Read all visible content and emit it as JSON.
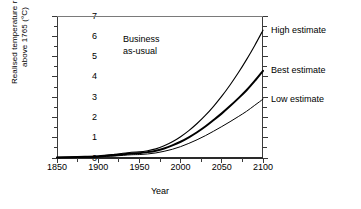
{
  "chart_data": {
    "type": "line",
    "title": "",
    "annotation": "Business\nas-usual",
    "xlabel": "Year",
    "ylabel": "Realised temperature rise\nabove 1765 (°C)",
    "xlim": [
      1850,
      2100
    ],
    "ylim": [
      0,
      7
    ],
    "xticks": [
      1850,
      1900,
      1950,
      2000,
      2050,
      2100
    ],
    "xticklabels": [
      "1850",
      "1900",
      "1950",
      "2000",
      "2050",
      "2100"
    ],
    "xminorticks": [
      1875,
      1925,
      1975,
      2025,
      2075
    ],
    "yticks": [
      0,
      1,
      2,
      3,
      4,
      5,
      6,
      7
    ],
    "yticklabels": [
      "0",
      "1",
      "2",
      "3",
      "4",
      "5",
      "6",
      "7"
    ],
    "yminorticks": [
      0.5,
      1.5,
      2.5,
      3.5,
      4.5,
      5.5,
      6.5
    ],
    "grid": false,
    "legend_position": "right-of-axes",
    "x": [
      1850,
      1875,
      1900,
      1920,
      1940,
      1950,
      1960,
      1970,
      1980,
      1990,
      2000,
      2010,
      2020,
      2030,
      2040,
      2050,
      2060,
      2070,
      2080,
      2090,
      2100
    ],
    "series": [
      {
        "name": "High estimate",
        "label": "High estimate",
        "color": "#000000",
        "linewidth": 1.1,
        "values": [
          0.03,
          0.06,
          0.1,
          0.18,
          0.28,
          0.3,
          0.36,
          0.45,
          0.6,
          0.8,
          1.05,
          1.35,
          1.7,
          2.1,
          2.55,
          3.05,
          3.6,
          4.2,
          4.85,
          5.55,
          6.3
        ]
      },
      {
        "name": "Best estimate",
        "label": "Best estimate",
        "color": "#000000",
        "linewidth": 2.0,
        "values": [
          0.02,
          0.05,
          0.08,
          0.14,
          0.22,
          0.24,
          0.29,
          0.36,
          0.47,
          0.62,
          0.8,
          1.02,
          1.27,
          1.55,
          1.87,
          2.2,
          2.56,
          2.94,
          3.34,
          3.8,
          4.3
        ]
      },
      {
        "name": "Low estimate",
        "label": "Low estimate",
        "color": "#000000",
        "linewidth": 1.0,
        "values": [
          0.02,
          0.04,
          0.06,
          0.1,
          0.16,
          0.17,
          0.2,
          0.25,
          0.33,
          0.43,
          0.56,
          0.72,
          0.9,
          1.1,
          1.32,
          1.55,
          1.79,
          2.04,
          2.3,
          2.6,
          2.9
        ]
      }
    ]
  }
}
